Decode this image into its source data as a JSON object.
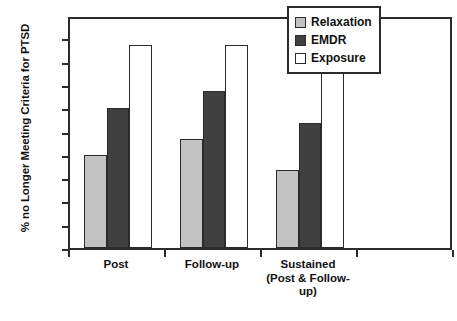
{
  "chart_data": {
    "type": "bar",
    "title": "",
    "xlabel": "",
    "ylabel": "% no Longer Meeting Criteria for PTSD",
    "ylim": [
      0,
      100
    ],
    "yticks": [
      0,
      10,
      20,
      30,
      40,
      50,
      60,
      70,
      80,
      90,
      100
    ],
    "ytick_labels": [
      "0",
      "10",
      "20",
      "30",
      "40",
      "50",
      "60",
      "70",
      "80",
      "90",
      "100"
    ],
    "grid": false,
    "legend_position": "top-right",
    "categories": [
      "Post",
      "Follow-up",
      "Sustained (Post & Follow-up)",
      ""
    ],
    "category_lines": [
      [
        "Post"
      ],
      [
        "Follow-up"
      ],
      [
        "Sustained",
        "(Post & Follow-",
        "up)"
      ],
      [
        ""
      ]
    ],
    "series": [
      {
        "name": "Relaxation",
        "color": "#c2c2c2",
        "values": [
          40,
          47,
          33.5,
          null
        ]
      },
      {
        "name": "EMDR",
        "color": "#404040",
        "values": [
          60,
          67.5,
          53.5,
          null
        ]
      },
      {
        "name": "Exposure",
        "color": "#ffffff",
        "values": [
          87,
          87,
          80,
          null
        ]
      }
    ]
  },
  "legend": {
    "items": [
      {
        "label": "Relaxation",
        "swatch": "relaxation"
      },
      {
        "label": "EMDR",
        "swatch": "emdr"
      },
      {
        "label": "Exposure",
        "swatch": "exposure"
      }
    ]
  },
  "caption": {
    "text": " "
  },
  "colors": {
    "axis": "#2b2b2b",
    "relaxation": "#c2c2c2",
    "emdr": "#404040",
    "exposure": "#ffffff",
    "background": "#ffffff"
  }
}
